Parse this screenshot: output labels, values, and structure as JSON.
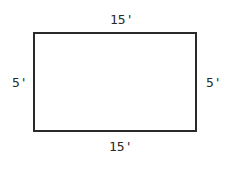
{
  "diagram": {
    "shape": "rectangle",
    "labels": {
      "top": "15'",
      "bottom": "15'",
      "left": "5'",
      "right": "5'"
    },
    "colors": {
      "stroke": "#2a2a2a",
      "background": "#ffffff"
    }
  }
}
